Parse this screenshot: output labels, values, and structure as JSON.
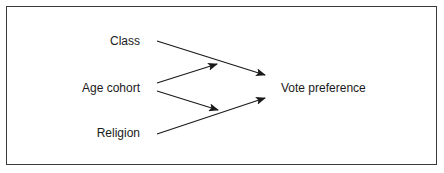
{
  "diagram": {
    "type": "causal-path",
    "sources": [
      {
        "id": "class",
        "label": "Class"
      },
      {
        "id": "age_cohort",
        "label": "Age cohort"
      },
      {
        "id": "religion",
        "label": "Religion"
      }
    ],
    "target": {
      "id": "vote_preference",
      "label": "Vote preference"
    },
    "edges": [
      {
        "from": "class",
        "to": "vote_preference"
      },
      {
        "from": "age_cohort",
        "to": "class_to_vote_path"
      },
      {
        "from": "age_cohort",
        "to": "religion_to_vote_path"
      },
      {
        "from": "religion",
        "to": "vote_preference"
      }
    ],
    "colors": {
      "line": "#1a1a1a",
      "text": "#1a1a1a",
      "frame": "#3a3a3a",
      "background": "#ffffff"
    }
  }
}
